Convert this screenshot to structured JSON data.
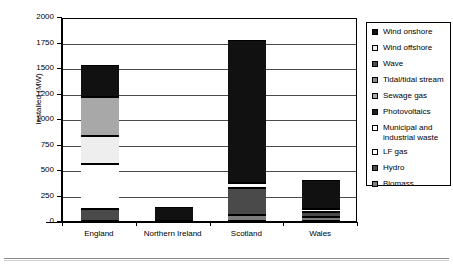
{
  "chart_data": {
    "type": "bar",
    "subtype": "stacked-vertical",
    "title": "",
    "xlabel": "",
    "ylabel": "Installed (MW)",
    "categories": [
      "England",
      "Northern Ireland",
      "Scotland",
      "Wales"
    ],
    "ytick_labels": [
      "0",
      "250",
      "500",
      "750",
      "1000",
      "1200",
      "1500",
      "1750",
      "2000"
    ],
    "ytick_values": [
      0,
      250,
      500,
      750,
      1000,
      1200,
      1500,
      1750,
      2000
    ],
    "ylim": [
      0,
      2000
    ],
    "axis_note": "Gridlines evenly spaced but labelled irregularly (1000 then 1200 then 1500)",
    "grid": true,
    "legend_position": "right",
    "series": [
      {
        "name": "Wind onshore",
        "color": "#111111",
        "values": [
          330,
          140,
          1400,
          195
        ]
      },
      {
        "name": "Wind offshore",
        "color": "#eeeeee",
        "values": [
          270,
          0,
          0,
          0
        ]
      },
      {
        "name": "Wave",
        "color": "#4a4a4a",
        "values": [
          0,
          0,
          0,
          0
        ]
      },
      {
        "name": "Tidal/tidal stream",
        "color": "#8a8a8a",
        "values": [
          0,
          0,
          0,
          0
        ]
      },
      {
        "name": "Sewage gas",
        "color": "#a8a8a8",
        "values": [
          340,
          0,
          0,
          0
        ]
      },
      {
        "name": "Photovoltaics",
        "color": "#1f1f1f",
        "values": [
          0,
          0,
          0,
          0
        ]
      },
      {
        "name": "Municipal and\nindustrial waste",
        "color": "#ffffff",
        "values": [
          440,
          0,
          0,
          0
        ]
      },
      {
        "name": "LF gas",
        "color": "#fbfbfb",
        "values": [
          0,
          0,
          50,
          28
        ]
      },
      {
        "name": "Hydro",
        "color": "#4a4a4a",
        "values": [
          120,
          0,
          265,
          52
        ]
      },
      {
        "name": "Biomass",
        "color": "#7d7d7d",
        "values": [
          0,
          0,
          60,
          38
        ]
      }
    ],
    "totals": [
      1530,
      140,
      1775,
      400
    ],
    "bar_segments": {
      "England": [
        {
          "series": "Hydro",
          "from": 0,
          "to": 120,
          "color": "#4a4a4a"
        },
        {
          "series": "Municipal and industrial waste",
          "from": 120,
          "to": 560,
          "color": "#ffffff"
        },
        {
          "series": "Wind offshore",
          "from": 560,
          "to": 830,
          "color": "#eeeeee"
        },
        {
          "series": "Sewage gas",
          "from": 830,
          "to": 1170,
          "color": "#a8a8a8"
        },
        {
          "series": "Wind onshore",
          "from": 1170,
          "to": 1530,
          "color": "#111111"
        }
      ],
      "Northern Ireland": [
        {
          "series": "Wind onshore",
          "from": 0,
          "to": 140,
          "color": "#111111"
        }
      ],
      "Scotland": [
        {
          "series": "Biomass",
          "from": 0,
          "to": 60,
          "color": "#7d7d7d"
        },
        {
          "series": "Hydro",
          "from": 60,
          "to": 325,
          "color": "#4a4a4a"
        },
        {
          "series": "LF gas",
          "from": 325,
          "to": 375,
          "color": "#fbfbfb"
        },
        {
          "series": "Wind onshore",
          "from": 375,
          "to": 1775,
          "color": "#111111"
        }
      ],
      "Wales": [
        {
          "series": "Biomass",
          "from": 0,
          "to": 38,
          "color": "#7d7d7d"
        },
        {
          "series": "Hydro",
          "from": 38,
          "to": 90,
          "color": "#4a4a4a"
        },
        {
          "series": "LF gas",
          "from": 90,
          "to": 118,
          "color": "#fbfbfb"
        },
        {
          "series": "Wind onshore",
          "from": 118,
          "to": 400,
          "color": "#111111"
        }
      ]
    }
  },
  "legend": {
    "items": [
      {
        "label": "Wind onshore",
        "color": "#111111"
      },
      {
        "label": "Wind offshore",
        "color": "#eeeeee"
      },
      {
        "label": "Wave",
        "color": "#4a4a4a"
      },
      {
        "label": "Tidal/tidal stream",
        "color": "#8a8a8a"
      },
      {
        "label": "Sewage gas",
        "color": "#a8a8a8"
      },
      {
        "label": "Photovoltaics",
        "color": "#1f1f1f"
      },
      {
        "label": "Municipal and\nindustrial waste",
        "color": "#ffffff"
      },
      {
        "label": "LF gas",
        "color": "#fbfbfb"
      },
      {
        "label": "Hydro",
        "color": "#4a4a4a"
      },
      {
        "label": "Biomass",
        "color": "#7d7d7d"
      }
    ]
  }
}
